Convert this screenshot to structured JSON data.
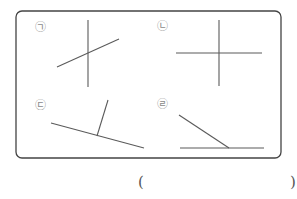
{
  "figure": {
    "frame": {
      "x": 16,
      "y": 11,
      "width": 265,
      "height": 147,
      "radius": 6,
      "stroke": "#444444"
    },
    "line_color": "#5a5a5a",
    "panels": [
      {
        "id": "panel-a",
        "label": "㉠",
        "label_pos": [
          35,
          22
        ],
        "lines": [
          {
            "x1": 88,
            "y1": 20,
            "x2": 88,
            "y2": 87
          },
          {
            "x1": 57,
            "y1": 67,
            "x2": 119,
            "y2": 39
          }
        ]
      },
      {
        "id": "panel-b",
        "label": "㉡",
        "label_pos": [
          157,
          21
        ],
        "lines": [
          {
            "x1": 219,
            "y1": 20,
            "x2": 219,
            "y2": 86
          },
          {
            "x1": 176,
            "y1": 53,
            "x2": 262,
            "y2": 53
          }
        ]
      },
      {
        "id": "panel-c",
        "label": "㉢",
        "label_pos": [
          35,
          100
        ],
        "lines": [
          {
            "x1": 51,
            "y1": 123,
            "x2": 144,
            "y2": 148
          },
          {
            "x1": 108,
            "y1": 100,
            "x2": 97,
            "y2": 136
          }
        ]
      },
      {
        "id": "panel-d",
        "label": "㉣",
        "label_pos": [
          157,
          99
        ],
        "lines": [
          {
            "x1": 180,
            "y1": 148,
            "x2": 264,
            "y2": 148
          },
          {
            "x1": 179,
            "y1": 115,
            "x2": 229,
            "y2": 148
          }
        ]
      }
    ]
  },
  "answer": {
    "open_paren": "(",
    "close_paren": ")",
    "value": ""
  }
}
